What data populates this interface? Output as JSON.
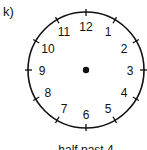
{
  "item_label": "k)",
  "clock": {
    "center": [
      86,
      70
    ],
    "radius": 58,
    "numerals": [
      "12",
      "1",
      "2",
      "3",
      "4",
      "5",
      "6",
      "7",
      "8",
      "9",
      "10",
      "11"
    ],
    "hands": "none",
    "colors": {
      "stroke": "#111111",
      "background": "#ffffff"
    }
  },
  "caption": "half past 4"
}
